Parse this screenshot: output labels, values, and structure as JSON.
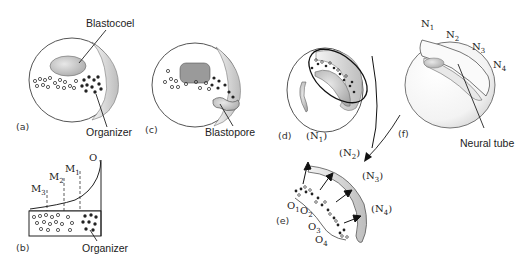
{
  "panels": {
    "a": {
      "label": "(a)",
      "callouts": [
        "Blastocoel",
        "Organizer"
      ]
    },
    "b": {
      "label": "(b)",
      "gradient_labels": [
        "M3",
        "M2",
        "M1",
        "O"
      ],
      "callouts": [
        "Organizer"
      ]
    },
    "c": {
      "label": "(c)",
      "callouts": [
        "Blastopore"
      ]
    },
    "d": {
      "label": "(d)",
      "neural_labels": [
        "(N1)"
      ]
    },
    "e": {
      "label": "(e)",
      "neural_labels": [
        "(N2)",
        "(N3)",
        "(N4)"
      ],
      "organizer_labels": [
        "O1",
        "O2",
        "O3",
        "O4"
      ]
    },
    "f": {
      "label": "(f)",
      "neural_labels": [
        "N1",
        "N2",
        "N3",
        "N4"
      ],
      "callouts": [
        "Neural tube"
      ]
    }
  }
}
